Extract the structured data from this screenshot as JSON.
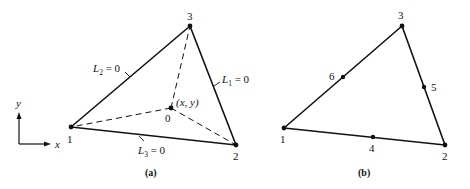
{
  "colors": {
    "stroke": "#111111",
    "background": "#ffffff"
  },
  "panel_a": {
    "caption": "(a)",
    "vertices": [
      {
        "id": "1",
        "label": "1",
        "x": 71,
        "y": 127,
        "lx": 70,
        "ly": 142
      },
      {
        "id": "2",
        "label": "2",
        "x": 236,
        "y": 145,
        "lx": 237,
        "ly": 159
      },
      {
        "id": "3",
        "label": "3",
        "x": 190,
        "y": 26,
        "lx": 190,
        "ly": 19
      }
    ],
    "interior_point": {
      "label": "0",
      "coord_label": "(x, y)",
      "x": 171,
      "y": 108
    },
    "edge_labels": {
      "L1": {
        "name": "L",
        "sub": "1",
        "rest": " = 0"
      },
      "L2": {
        "name": "L",
        "sub": "2",
        "rest": " = 0"
      },
      "L3": {
        "name": "L",
        "sub": "3",
        "rest": " = 0"
      }
    },
    "axes": {
      "x_label": "x",
      "y_label": "y"
    }
  },
  "panel_b": {
    "caption": "(b)",
    "vertices": [
      {
        "id": "1",
        "label": "1",
        "x": 284,
        "y": 128
      },
      {
        "id": "2",
        "label": "2",
        "x": 445,
        "y": 145
      },
      {
        "id": "3",
        "label": "3",
        "x": 402,
        "y": 26
      }
    ],
    "midside_nodes": [
      {
        "id": "4",
        "label": "4",
        "x": 373,
        "y": 137
      },
      {
        "id": "5",
        "label": "5",
        "x": 424,
        "y": 87
      },
      {
        "id": "6",
        "label": "6",
        "x": 343,
        "y": 77
      }
    ]
  }
}
